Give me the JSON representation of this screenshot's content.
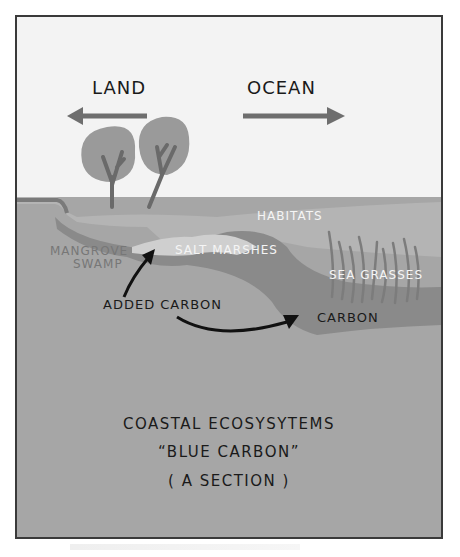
{
  "diagram": {
    "direction_labels": {
      "land": "LAND",
      "ocean": "OCEAN"
    },
    "region_labels": {
      "habitats": "HABITATS",
      "mangrove_swamp_line1": "MANGROVE",
      "mangrove_swamp_line2": "SWAMP",
      "salt_marshes": "SALT MARSHES",
      "sea_grasses": "SEA GRASSES",
      "added_carbon": "ADDED CARBON",
      "carbon": "CARBON"
    },
    "caption": {
      "line1": "COASTAL ECOSYSYTEMS",
      "line2": "“BLUE CARBON”",
      "line3": "( A SECTION )"
    },
    "colors": {
      "sky": "#f3f3f3",
      "habitat_layer": "#b4b4b4",
      "sediment": "#a6a6a6",
      "carbon_band": "#8a8a8a",
      "trees": "#9a9a9a",
      "arrow_gray": "#6e6e6e",
      "ink": "#1a1a1a"
    }
  }
}
